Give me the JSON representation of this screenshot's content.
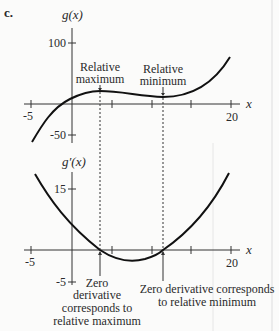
{
  "part_label": "c.",
  "top_graph": {
    "y_label": "g(x)",
    "x_label": "x",
    "y_ticks": [
      {
        "value": 100,
        "label": "100"
      },
      {
        "value": -50,
        "label": "-50"
      }
    ],
    "x_ticks": [
      {
        "value": -5,
        "label": "-5"
      },
      {
        "value": 5,
        "label": ""
      },
      {
        "value": 15,
        "label": ""
      },
      {
        "value": 20,
        "label": "20"
      }
    ],
    "annotations": {
      "max_line1": "Relative",
      "max_line2": "maximum",
      "min_line1": "Relative",
      "min_line2": "minimum"
    }
  },
  "bottom_graph": {
    "y_label": "g′(x)",
    "x_label": "x",
    "y_ticks": [
      {
        "value": 15,
        "label": "15"
      },
      {
        "value": -5,
        "label": "-5"
      }
    ],
    "x_ticks": [
      {
        "value": -5,
        "label": "-5"
      },
      {
        "value": 5,
        "label": ""
      },
      {
        "value": 10,
        "label": ""
      },
      {
        "value": 15,
        "label": ""
      },
      {
        "value": 20,
        "label": "20"
      }
    ],
    "annotations": {
      "zero_max_line1": "Zero",
      "zero_max_line2": "derivative",
      "zero_max_line3": "corresponds to",
      "zero_max_line4": "relative maximum",
      "zero_min_line1": "Zero derivative corresponds",
      "zero_min_line2": "to relative minimum"
    }
  },
  "colors": {
    "curve": "#111111",
    "axis": "#333333",
    "background": "#fbfbfa"
  }
}
